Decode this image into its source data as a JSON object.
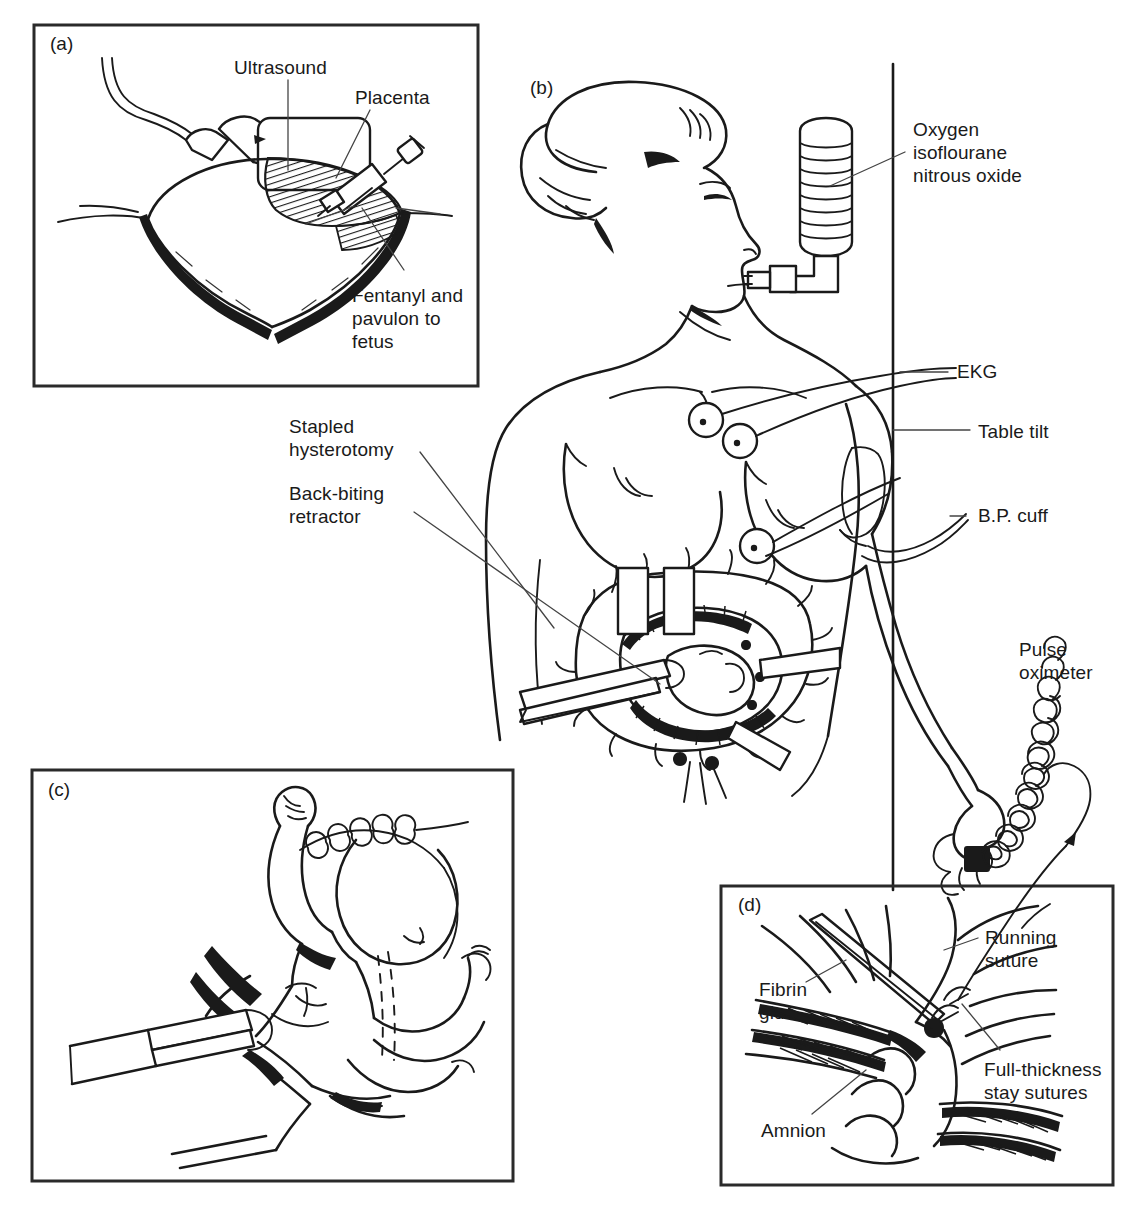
{
  "figure": {
    "width": 1139,
    "height": 1210,
    "background_color": "#ffffff",
    "ink_color": "#1a1a1a"
  },
  "panels": [
    {
      "id": "a",
      "tag": "(a)",
      "caption_subject": "Ultrasound-guided fetal injection through the gravid uterus",
      "frame": {
        "x": 34,
        "y": 25,
        "width": 444,
        "height": 361
      },
      "labels": [
        {
          "key": "ultrasound",
          "text": "Ultrasound",
          "x": 234,
          "y": 56,
          "align": "left"
        },
        {
          "key": "placenta",
          "text": "Placenta",
          "x": 355,
          "y": 86,
          "align": "left"
        },
        {
          "key": "fentanyl",
          "text": "Fentanyl and\npavulon to\nfetus",
          "x": 352,
          "y": 284,
          "align": "left"
        }
      ]
    },
    {
      "id": "b",
      "tag": "(b)",
      "caption_subject": "Maternal positioning, anesthesia and monitoring with exposed hysterotomy",
      "frame": null,
      "labels": [
        {
          "key": "oxygen",
          "text": "Oxygen\nisoflourane\nnitrous oxide",
          "x": 913,
          "y": 118,
          "align": "left"
        },
        {
          "key": "ekg",
          "text": "EKG",
          "x": 957,
          "y": 360,
          "align": "left"
        },
        {
          "key": "table-tilt",
          "text": "Table tilt",
          "x": 978,
          "y": 420,
          "align": "left"
        },
        {
          "key": "bp-cuff",
          "text": "B.P. cuff",
          "x": 978,
          "y": 504,
          "align": "left"
        },
        {
          "key": "pulse-oximeter",
          "text": "Pulse\noximeter",
          "x": 1019,
          "y": 638,
          "align": "left"
        },
        {
          "key": "stapled-hysterotomy",
          "text": "Stapled\nhysterotomy",
          "x": 289,
          "y": 415,
          "align": "left"
        },
        {
          "key": "back-biting-retractor",
          "text": "Back-biting\nretractor",
          "x": 289,
          "y": 482,
          "align": "left"
        }
      ]
    },
    {
      "id": "c",
      "tag": "(c)",
      "caption_subject": "Fetus exteriorized through hysterotomy with retractors in place",
      "frame": {
        "x": 32,
        "y": 770,
        "width": 481,
        "height": 411
      },
      "labels": []
    },
    {
      "id": "d",
      "tag": "(d)",
      "caption_subject": "Closure of the uterus with running suture, fibrin glue and stay sutures",
      "frame": {
        "x": 721,
        "y": 886,
        "width": 392,
        "height": 299
      },
      "labels": [
        {
          "key": "running-suture",
          "text": "Running\nsuture",
          "x": 985,
          "y": 926,
          "align": "left"
        },
        {
          "key": "fibrin-glue",
          "text": "Fibrin\nglue",
          "x": 759,
          "y": 978,
          "align": "left"
        },
        {
          "key": "amnion",
          "text": "Amnion",
          "x": 761,
          "y": 1119,
          "align": "left"
        },
        {
          "key": "full-thickness-stay-sutures",
          "text": "Full-thickness\nstay sutures",
          "x": 984,
          "y": 1058,
          "align": "left"
        }
      ]
    }
  ],
  "panel_tags": [
    {
      "id": "tag-a",
      "text": "(a)",
      "x": 50,
      "y": 44
    },
    {
      "id": "tag-b",
      "text": "(b)",
      "x": 530,
      "y": 88
    },
    {
      "id": "tag-c",
      "text": "(c)",
      "x": 48,
      "y": 790
    },
    {
      "id": "tag-d",
      "text": "(d)",
      "x": 738,
      "y": 905
    }
  ],
  "equipment_depicted": [
    "ultrasound-transducer",
    "syringe",
    "anesthesia-bellows",
    "mouth-airway-connector",
    "ekg-electrodes",
    "blood-pressure-cuff",
    "pulse-oximeter-probe",
    "operating-table-edge",
    "back-biting-retractor",
    "uterine-stapler-line",
    "surgical-forceps",
    "suture-needle"
  ]
}
